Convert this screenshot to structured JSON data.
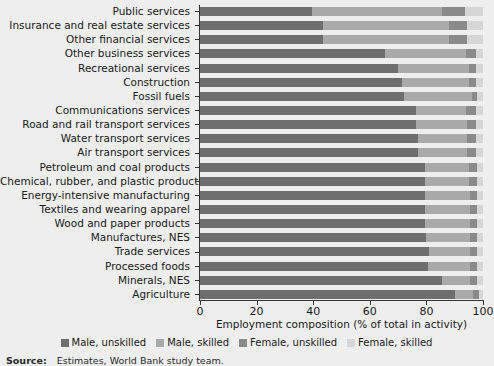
{
  "chart_data": {
    "type": "bar",
    "orientation": "horizontal",
    "stacked": true,
    "stack_mode": "percent",
    "title": "",
    "subtitle": "",
    "xlabel": "Employment composition (% of total in activity)",
    "ylabel": "",
    "xlim": [
      0,
      100
    ],
    "xticks": [
      0,
      20,
      40,
      60,
      80,
      100
    ],
    "xtick_labels": [
      "0",
      "20",
      "40",
      "60",
      "80",
      "100"
    ],
    "grid": false,
    "legend_position": "bottom",
    "categories": [
      "Public services",
      "Insurance and real estate services",
      "Other financial services",
      "Other business services",
      "Recreational services",
      "Construction",
      "Fossil fuels",
      "Communications services",
      "Road and rail transport services",
      "Water transport services",
      "Air transport services",
      "Petroleum and coal products",
      "Chemical, rubber, and plastic products",
      "Energy-intensive manufacturing",
      "Textiles and wearing apparel",
      "Wood and paper products",
      "Manufactures, NES",
      "Trade services",
      "Processed foods",
      "Minerals, NES",
      "Agriculture"
    ],
    "series": [
      {
        "name": "Male, unskilled",
        "color": "#6e6e6e",
        "values": [
          39.5,
          43.5,
          43.5,
          65.5,
          70.0,
          71.5,
          72.0,
          76.5,
          76.5,
          77.0,
          77.0,
          79.5,
          79.5,
          79.5,
          79.5,
          79.5,
          80.0,
          81.0,
          80.5,
          85.5,
          90.0
        ]
      },
      {
        "name": "Male, skilled",
        "color": "#a9a9a9",
        "values": [
          46.0,
          44.5,
          44.5,
          28.5,
          25.0,
          23.5,
          24.0,
          17.5,
          18.0,
          17.5,
          17.5,
          15.5,
          15.5,
          16.0,
          16.0,
          16.0,
          15.5,
          14.5,
          15.0,
          10.0,
          6.5
        ]
      },
      {
        "name": "Female, unskilled",
        "color": "#8a8a8a",
        "values": [
          8.0,
          6.5,
          6.5,
          3.5,
          2.5,
          2.5,
          2.0,
          3.5,
          3.0,
          3.0,
          3.0,
          3.0,
          3.0,
          2.5,
          2.5,
          2.5,
          2.5,
          2.5,
          2.5,
          2.5,
          2.0
        ]
      },
      {
        "name": "Female, skilled",
        "color": "#d6d6d6",
        "values": [
          6.5,
          5.5,
          5.5,
          2.5,
          2.5,
          2.5,
          2.0,
          2.5,
          2.5,
          2.5,
          2.5,
          2.0,
          2.0,
          2.0,
          2.0,
          2.0,
          2.0,
          2.0,
          2.0,
          2.0,
          1.5
        ]
      }
    ]
  },
  "axis": {
    "x_title": "Employment composition (% of total in activity)"
  },
  "legend": {
    "items": [
      {
        "label": "Male, unskilled",
        "color": "#6e6e6e"
      },
      {
        "label": "Male, skilled",
        "color": "#a9a9a9"
      },
      {
        "label": "Female, unskilled",
        "color": "#8a8a8a"
      },
      {
        "label": "Female, skilled",
        "color": "#d6d6d6"
      }
    ]
  },
  "source": {
    "label": "Source:",
    "text": "Estimates, World Bank study team."
  },
  "colors": {
    "background": "#eeeeee",
    "axis": "#333333",
    "text": "#1a1a1a"
  }
}
